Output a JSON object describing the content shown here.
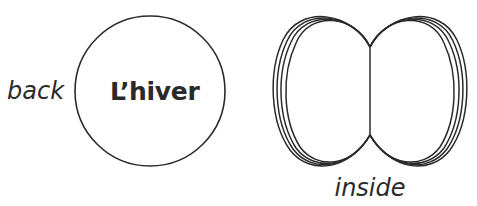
{
  "diagram": {
    "back_view": {
      "side_label": "back",
      "card_title": "L’hiver",
      "shape": "circle"
    },
    "inside_view": {
      "caption": "inside",
      "shape": "two-lobed folded card with stacked pages",
      "page_layers": 4
    },
    "colors": {
      "stroke": "#2a2a2a",
      "background": "#ffffff",
      "text": "#2a2a2a"
    }
  }
}
